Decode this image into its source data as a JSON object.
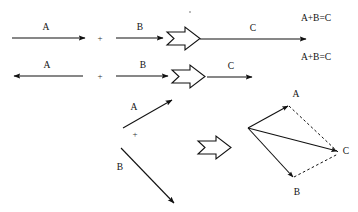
{
  "figure": {
    "colors": {
      "stroke": "#111111",
      "background": "#ffffff",
      "dashed_stroke": "#111111"
    },
    "rows": [
      {
        "id": "row-1",
        "description": "A rightward plus B rightward yields C rightward",
        "operand_a_label": "A",
        "operand_a_direction": "right",
        "plus_sign": "+",
        "operand_b_label": "B",
        "operand_b_direction": "right",
        "implies_symbol": "⇒",
        "result_label": "C",
        "result_direction": "right",
        "equation": "A+B=C"
      },
      {
        "id": "row-2",
        "description": "A leftward plus B rightward yields C rightward (shorter)",
        "operand_a_label": "A",
        "operand_a_direction": "left",
        "plus_sign": "+",
        "operand_b_label": "B",
        "operand_b_direction": "right",
        "implies_symbol": "⇒",
        "result_label": "C",
        "result_direction": "right",
        "equation": "A+B=C"
      },
      {
        "id": "row-3",
        "description": "A up-right plus B down-right yields C by parallelogram rule",
        "operand_a_label": "A",
        "operand_a_direction": "up-right",
        "plus_sign": "+",
        "operand_b_label": "B",
        "operand_b_direction": "down-right",
        "implies_symbol": "⇒",
        "result_label": "C",
        "result_direction": "right",
        "parallelogram": {
          "origin_label": "",
          "vertex_a_label": "A",
          "vertex_b_label": "B",
          "vertex_c_label": "C",
          "solid_edges": [
            "origin-A",
            "origin-B",
            "origin-C"
          ],
          "dashed_edges": [
            "A-C",
            "B-C"
          ]
        }
      }
    ]
  }
}
